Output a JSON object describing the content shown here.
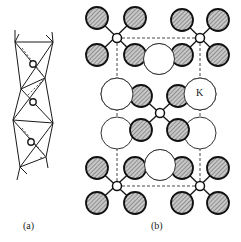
{
  "figure": {
    "panel_a_label": "(a)",
    "panel_b_label": "(b)",
    "atom_label_k": "K"
  },
  "colors": {
    "line": "#1a1a1a",
    "shaded_fill": "#bdbdbd",
    "hatch": "#555555",
    "white_atom": "#ffffff"
  }
}
